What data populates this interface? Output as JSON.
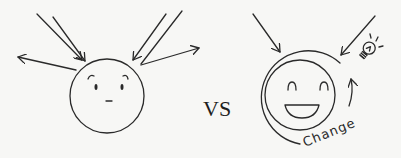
{
  "diagram": {
    "title": "",
    "left_panel": {
      "name": "closed-mindset-face",
      "expression": "neutral",
      "incoming_arrows": 4,
      "deflected_arrows": 2
    },
    "separator": {
      "label": "VS"
    },
    "right_panel": {
      "name": "open-mindset-face",
      "expression": "happy",
      "incoming_arrows": 2,
      "ring_label": "Change",
      "icons": [
        "lightbulb-icon",
        "cycle-arrow-icon"
      ]
    },
    "colors": {
      "background": "#f7f7f5",
      "ink": "#2a2a2a"
    }
  }
}
